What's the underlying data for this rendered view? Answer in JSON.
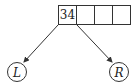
{
  "diagram": {
    "type": "tree-node",
    "node": {
      "cells": [
        "34",
        "",
        "",
        ""
      ]
    },
    "children": [
      {
        "label": "L",
        "position": "left"
      },
      {
        "label": "R",
        "position": "right"
      }
    ],
    "colors": {
      "stroke": "#333333",
      "background": "#ffffff"
    }
  }
}
